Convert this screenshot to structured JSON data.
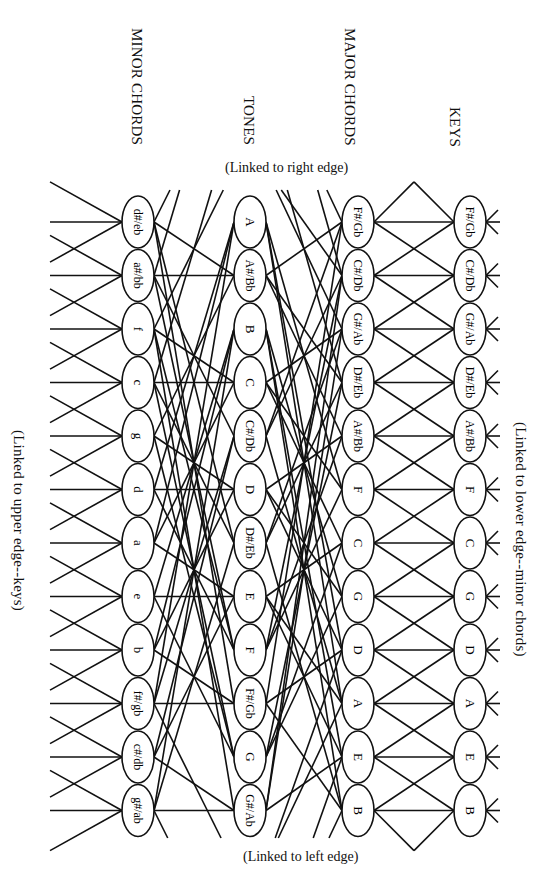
{
  "headers": {
    "minor": "MINOR CHORDS",
    "tones": "TONES",
    "major": "MAJOR CHORDS",
    "keys": "KEYS"
  },
  "edge_notes": {
    "top": "(Linked to right edge)",
    "bottom": "(Linked to left edge)",
    "right": "(Linked to lower edge--minor chords)",
    "left": "(Linked to upper edge--keys)"
  },
  "columns": {
    "keys": [
      "F#/Gb",
      "C#/Db",
      "G#/Ab",
      "D#/Eb",
      "A#/Bb",
      "F",
      "C",
      "G",
      "D",
      "A",
      "E",
      "B"
    ],
    "major_chords": [
      "F#/Gb",
      "C#/Db",
      "G#/Ab",
      "D#/Eb",
      "A#/Bb",
      "F",
      "C",
      "G",
      "D",
      "A",
      "E",
      "B"
    ],
    "tones": [
      "A",
      "A#/Bb",
      "B",
      "C",
      "C#/Db",
      "D",
      "D#/Eb",
      "E",
      "F",
      "F#/Gb",
      "G",
      "G#/Ab"
    ],
    "minor_chords": [
      "d#/eb",
      "a#/bb",
      "f",
      "c",
      "g",
      "d",
      "a",
      "e",
      "b",
      "f#/gb",
      "c#/db",
      "g#/ab"
    ]
  },
  "layout": {
    "x": {
      "keys": 470,
      "major": 358,
      "tones": 250,
      "minor": 138
    },
    "row_y0": 222,
    "row_dy": 53.5,
    "line_color": "#111111"
  }
}
